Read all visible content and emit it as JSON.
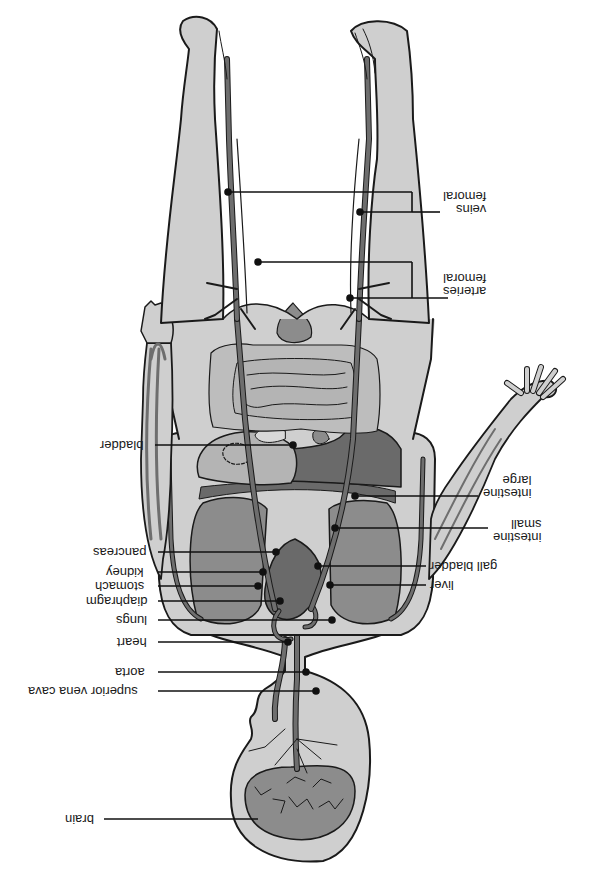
{
  "diagram": {
    "orientation": "rotated 180 degrees",
    "colors": {
      "skin": "#cfcfcf",
      "outline": "#1a1a1a",
      "vessel": "#6e6e6e",
      "organ_dark": "#6a6a6a",
      "organ_mid": "#8c8c8c",
      "organ_light": "#b4b4b4",
      "intestine": "#bdbdbd",
      "leader": "#111111"
    },
    "labels": {
      "femoral_veins": [
        "femoral",
        "veins"
      ],
      "femoral_arteries": [
        "femoral",
        "arteries"
      ],
      "bladder": "bladder",
      "large_intestine": [
        "large",
        "intestine"
      ],
      "small_intestine": [
        "small",
        "intestine"
      ],
      "gall_bladder": "gall bladder",
      "liver": "liver",
      "pancreas": "pancreas",
      "kidney": "kidney",
      "stomach": "stomach",
      "diaphragm": "diaphragm",
      "lungs": "lungs",
      "heart": "heart",
      "aorta": "aorta",
      "superior_vena_cava": "superior vena cava",
      "brain": "brain"
    }
  }
}
